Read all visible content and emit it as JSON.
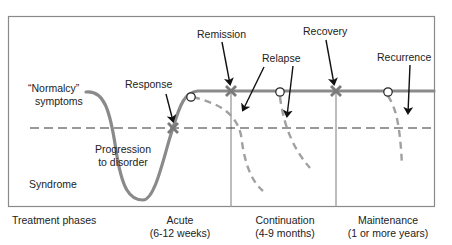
{
  "diagram": {
    "type": "depression-course-treatment-phases",
    "colors": {
      "frame": "#8a8a8a",
      "curve": "#8a8a8a",
      "dashed_relapse": "#a0a0a0",
      "threshold": "#333333",
      "arrow": "#111111",
      "marker_x": "#7a7a7a",
      "background": "#ffffff"
    },
    "labels": {
      "normalcy_line1": "“Normalcy”",
      "normalcy_line2": "symptoms",
      "syndrome": "Syndrome",
      "progression_line1": "Progression",
      "progression_line2": "to disorder",
      "response": "Response",
      "remission": "Remission",
      "relapse": "Relapse",
      "recovery": "Recovery",
      "recurrence": "Recurrence"
    },
    "phases": {
      "title": "Treatment phases",
      "items": [
        {
          "name": "Acute",
          "duration": "(6-12 weeks)"
        },
        {
          "name": "Continuation",
          "duration": "(4-9 months)"
        },
        {
          "name": "Maintenance",
          "duration": "(1 or more years)"
        }
      ]
    }
  }
}
